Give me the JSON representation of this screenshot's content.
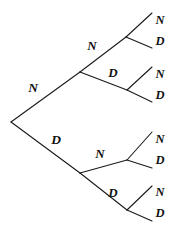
{
  "diagram": {
    "type": "binary-tree",
    "depth": 3,
    "stroke_color": "#1a1a1a",
    "background_color": "#ffffff",
    "outcome_symbols": [
      "N",
      "D"
    ],
    "root": {
      "x": 11,
      "y": 122
    },
    "labels": {
      "level1": [
        {
          "text": "N",
          "x": 33,
          "y": 88
        },
        {
          "text": "D",
          "x": 56,
          "y": 140
        }
      ],
      "level2": [
        {
          "text": "N",
          "x": 92,
          "y": 45
        },
        {
          "text": "D",
          "x": 113,
          "y": 72
        },
        {
          "text": "N",
          "x": 100,
          "y": 153
        },
        {
          "text": "D",
          "x": 113,
          "y": 192
        }
      ],
      "level3": [
        {
          "text": "N",
          "x": 160,
          "y": 20
        },
        {
          "text": "D",
          "x": 160,
          "y": 41
        },
        {
          "text": "N",
          "x": 160,
          "y": 74
        },
        {
          "text": "D",
          "x": 160,
          "y": 95
        },
        {
          "text": "N",
          "x": 160,
          "y": 139
        },
        {
          "text": "D",
          "x": 160,
          "y": 160
        },
        {
          "text": "N",
          "x": 160,
          "y": 192
        },
        {
          "text": "D",
          "x": 160,
          "y": 213
        }
      ]
    },
    "edges": {
      "level1": [
        {
          "name": "root-to-upper",
          "x1": 11,
          "y1": 122,
          "x2": 80,
          "y2": 72
        },
        {
          "name": "root-to-lower",
          "x1": 11,
          "y1": 122,
          "x2": 80,
          "y2": 173
        }
      ],
      "level2": [
        {
          "name": "upper-to-nn",
          "x1": 80,
          "y1": 72,
          "x2": 126,
          "y2": 37
        },
        {
          "name": "upper-to-nd",
          "x1": 80,
          "y1": 72,
          "x2": 127,
          "y2": 90
        },
        {
          "name": "lower-to-dn",
          "x1": 80,
          "y1": 173,
          "x2": 127,
          "y2": 160
        },
        {
          "name": "lower-to-dd",
          "x1": 80,
          "y1": 173,
          "x2": 127,
          "y2": 210
        }
      ],
      "level3": [
        {
          "name": "nn-to-n",
          "x1": 126,
          "y1": 37,
          "x2": 152,
          "y2": 13
        },
        {
          "name": "nn-to-d",
          "x1": 126,
          "y1": 37,
          "x2": 152,
          "y2": 48
        },
        {
          "name": "nd-to-n",
          "x1": 127,
          "y1": 90,
          "x2": 152,
          "y2": 67
        },
        {
          "name": "nd-to-d",
          "x1": 127,
          "y1": 90,
          "x2": 152,
          "y2": 102
        },
        {
          "name": "dn-to-n",
          "x1": 127,
          "y1": 160,
          "x2": 152,
          "y2": 132
        },
        {
          "name": "dn-to-d",
          "x1": 127,
          "y1": 160,
          "x2": 152,
          "y2": 168
        },
        {
          "name": "dd-to-n",
          "x1": 127,
          "y1": 210,
          "x2": 152,
          "y2": 186
        },
        {
          "name": "dd-to-d",
          "x1": 127,
          "y1": 210,
          "x2": 152,
          "y2": 221
        }
      ]
    }
  }
}
